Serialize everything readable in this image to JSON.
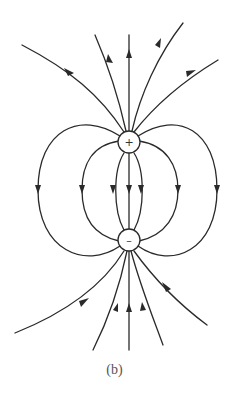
{
  "figure": {
    "caption": "(b)",
    "colors": {
      "ink": "#2a2a2a",
      "background": "#ffffff"
    },
    "charges": [
      {
        "id": "positive",
        "sign": "+",
        "cx": 129,
        "cy": 142,
        "r": 11
      },
      {
        "id": "negative",
        "sign": "–",
        "cx": 129,
        "cy": 240,
        "r": 11
      }
    ],
    "field_line_counts": {
      "outgoing_top": 5,
      "connecting_loops": 7,
      "incoming_bottom": 5
    }
  }
}
